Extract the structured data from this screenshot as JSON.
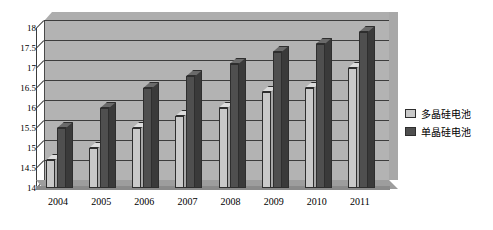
{
  "chart_data": {
    "type": "bar",
    "title": "",
    "subtitle": "",
    "xlabel": "",
    "ylabel": "",
    "categories": [
      "2004",
      "2005",
      "2006",
      "2007",
      "2008",
      "2009",
      "2010",
      "2011"
    ],
    "series": [
      {
        "name": "多晶硅电池",
        "color": "#c9c9c9",
        "values": [
          14.7,
          15.0,
          15.5,
          15.8,
          16.0,
          16.4,
          16.5,
          17.0
        ]
      },
      {
        "name": "单晶硅电池",
        "color": "#4f4f4f",
        "values": [
          15.5,
          16.0,
          16.5,
          16.8,
          17.1,
          17.4,
          17.6,
          17.9
        ]
      }
    ],
    "ylim": [
      14,
      18
    ],
    "yticks": [
      "14",
      "14.5",
      "15",
      "15.5",
      "16",
      "16.5",
      "17",
      "17.5",
      "18"
    ],
    "ytick_values": [
      14,
      14.5,
      15,
      15.5,
      16,
      16.5,
      17,
      17.5,
      18
    ],
    "grid": true,
    "legend_position": "right",
    "style": "3d-column",
    "plot_background": "#b3b3b3",
    "gridline_color": "#3d3d3d"
  },
  "legend": {
    "items": [
      {
        "label": "多晶硅电池",
        "swatch": "light"
      },
      {
        "label": "单晶硅电池",
        "swatch": "dark"
      }
    ]
  }
}
